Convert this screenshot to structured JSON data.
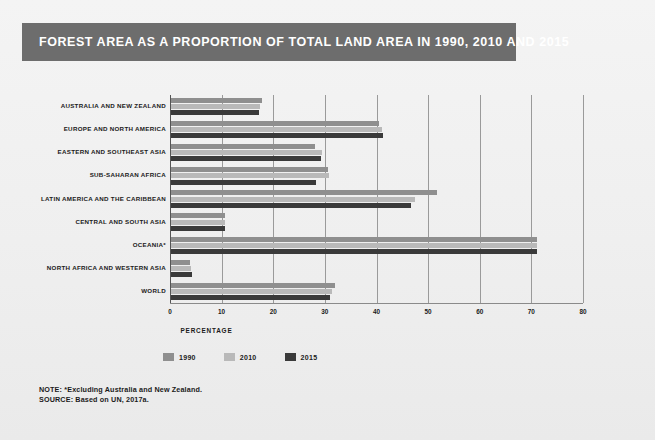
{
  "title": "FOREST AREA AS A PROPORTION OF TOTAL LAND AREA IN 1990, 2010 AND 2015",
  "notes": {
    "note": "NOTE: *Excluding Australia and New Zealand.",
    "source": "SOURCE: Based on UN, 2017a."
  },
  "colors": {
    "title_bar": "#6d6d6d",
    "background": "#f2f2f2",
    "series_1990": "#8f8f8f",
    "series_2010": "#b9b9b9",
    "series_2015": "#3a3a3a",
    "gridline": "#9a9a9a",
    "text": "#1a1a1a"
  },
  "chart_data": {
    "type": "bar",
    "orientation": "horizontal",
    "title": "FOREST AREA AS A PROPORTION OF TOTAL LAND AREA IN 1990, 2010 AND 2015",
    "xlabel": "PERCENTAGE",
    "ylabel": "",
    "xlim": [
      0,
      80
    ],
    "xticks": [
      0,
      10,
      20,
      30,
      40,
      50,
      60,
      70,
      80
    ],
    "xtick_labels": [
      "0",
      "10",
      "20",
      "30",
      "40",
      "50",
      "60",
      "70",
      "80"
    ],
    "grid": true,
    "legend_position": "bottom-left",
    "categories": [
      "AUSTRALIA AND NEW ZEALAND",
      "EUROPE AND NORTH AMERICA",
      "EASTERN AND SOUTHEAST ASIA",
      "SUB-SAHARAN AFRICA",
      "LATIN AMERICA AND THE CARIBBEAN",
      "CENTRAL AND SOUTH ASIA",
      "OCEANIA*",
      "NORTH AFRICA AND WESTERN ASIA",
      "WORLD"
    ],
    "series": [
      {
        "name": "1990",
        "color": "#8f8f8f",
        "values": [
          17.6,
          40.2,
          27.9,
          30.4,
          51.6,
          10.4,
          70.8,
          3.7,
          31.8
        ]
      },
      {
        "name": "2010",
        "color": "#b9b9b9",
        "values": [
          17.2,
          40.9,
          29.3,
          30.6,
          47.2,
          10.5,
          70.9,
          3.8,
          31.1
        ]
      },
      {
        "name": "2015",
        "color": "#3a3a3a",
        "values": [
          17.1,
          41.0,
          29.1,
          28.0,
          46.4,
          10.4,
          70.8,
          4.1,
          30.8
        ]
      }
    ]
  }
}
